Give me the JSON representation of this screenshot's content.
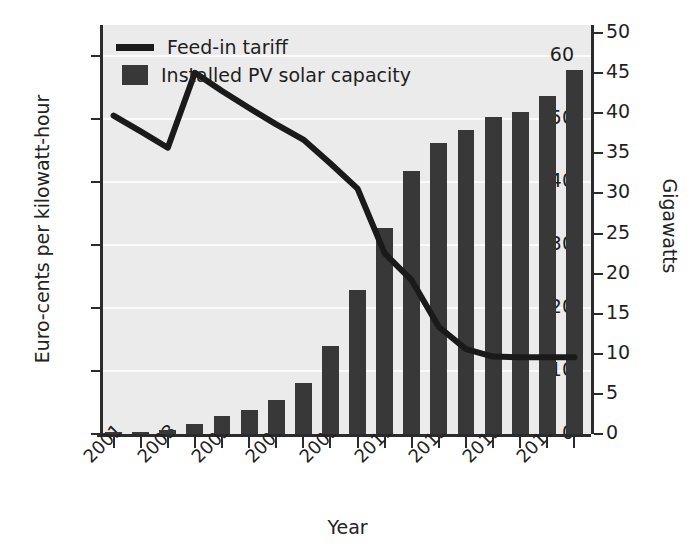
{
  "chart_data": {
    "type": "bar",
    "title": "",
    "xlabel": "Year",
    "ylabel": "Euro-cents per kilowatt-hour",
    "ylabel_right": "Gigawatts",
    "grid": true,
    "legend_position": "top-left",
    "x": [
      2001,
      2002,
      2003,
      2004,
      2005,
      2006,
      2007,
      2008,
      2009,
      2010,
      2011,
      2012,
      2013,
      2014,
      2015,
      2016,
      2017,
      2018
    ],
    "xtick_labels": [
      "2001",
      "2003",
      "2005",
      "2007",
      "2009",
      "2011",
      "2013",
      "2015",
      "2017"
    ],
    "xtick_years": [
      2001,
      2003,
      2005,
      2007,
      2009,
      2011,
      2013,
      2015,
      2017
    ],
    "ylim": [
      0,
      65
    ],
    "yticks": [
      0,
      10,
      20,
      30,
      40,
      50,
      60
    ],
    "ylim_right": [
      0,
      51
    ],
    "yticks_right": [
      0,
      5,
      10,
      15,
      20,
      25,
      30,
      35,
      40,
      45,
      50
    ],
    "series": [
      {
        "name": "Installed PV solar capacity",
        "type": "bar",
        "axis": "right",
        "unit": "Gigawatts",
        "color": "#383838",
        "values": [
          0.2,
          0.3,
          0.5,
          1.2,
          2.2,
          3.0,
          4.2,
          6.3,
          11.0,
          18.0,
          25.7,
          32.8,
          36.3,
          37.9,
          39.5,
          40.2,
          42.1,
          45.4
        ]
      },
      {
        "name": "Feed-in tariff",
        "type": "line",
        "axis": "left",
        "unit": "Euro-cents per kilowatt-hour",
        "color": "#1a1a1a",
        "values": [
          50.6,
          48.1,
          45.5,
          57.4,
          54.5,
          51.8,
          49.2,
          46.8,
          43.0,
          39.0,
          28.7,
          24.4,
          17.0,
          13.5,
          12.3,
          12.2,
          12.2,
          12.2
        ]
      }
    ]
  },
  "legend": {
    "items": [
      {
        "label": "Feed-in tariff",
        "marker": "line",
        "color": "#1a1a1a"
      },
      {
        "label": "Installed PV solar capacity",
        "marker": "bar",
        "color": "#383838"
      }
    ]
  },
  "axes": {
    "left": {
      "title": "Euro-cents per kilowatt-hour",
      "tick_labels": [
        "60",
        "50",
        "40",
        "30",
        "20",
        "10",
        "0"
      ]
    },
    "right": {
      "title": "Gigawatts",
      "tick_labels": [
        "50",
        "45",
        "40",
        "35",
        "30",
        "25",
        "20",
        "15",
        "10",
        "5",
        "0"
      ]
    },
    "bottom": {
      "title": "Year",
      "tick_labels": [
        "2001",
        "2003",
        "2005",
        "2007",
        "2009",
        "2011",
        "2013",
        "2015",
        "2017"
      ]
    }
  },
  "colors": {
    "bar": "#383838",
    "line": "#1a1a1a",
    "plot_background": "#ebebeb",
    "gridline": "#fbfbfb",
    "axis": "#2b2b2b",
    "text": "#1f1f1f"
  }
}
